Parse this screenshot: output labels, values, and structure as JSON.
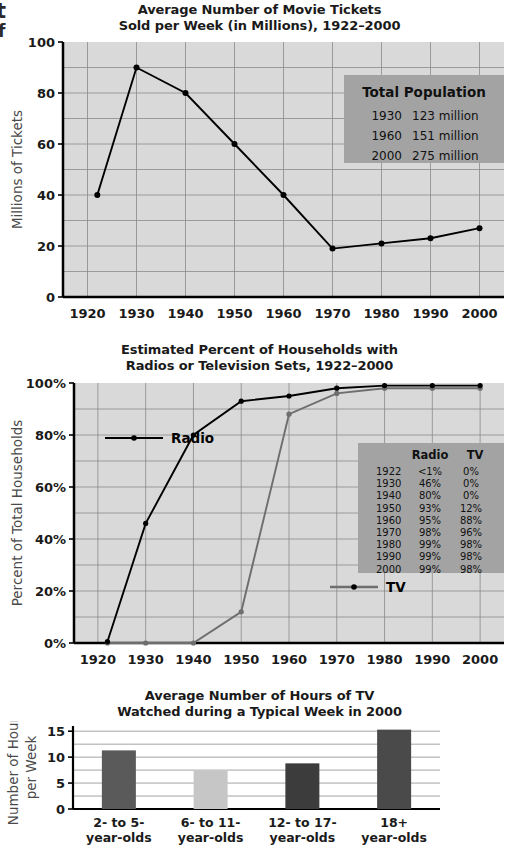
{
  "page": {
    "cut_off_margin_line1": "t",
    "cut_off_margin_line2": "f"
  },
  "chart_data": [
    {
      "id": "movie-tickets",
      "type": "line",
      "title_line1": "Average Number of Movie Tickets",
      "title_line2": "Sold per Week (in Millions), 1922–2000",
      "xlabel": "",
      "ylabel": "Millions of Tickets",
      "xlim": [
        1915,
        2005
      ],
      "ylim": [
        0,
        100
      ],
      "xticks": [
        "1920",
        "1930",
        "1940",
        "1950",
        "1960",
        "1970",
        "1980",
        "1990",
        "2000"
      ],
      "xtick_values": [
        1920,
        1930,
        1940,
        1950,
        1960,
        1970,
        1980,
        1990,
        2000
      ],
      "yticks": [
        "0",
        "20",
        "40",
        "60",
        "80",
        "100"
      ],
      "ytick_values": [
        0,
        20,
        40,
        60,
        80,
        100
      ],
      "grid": true,
      "x": [
        1922,
        1930,
        1940,
        1950,
        1960,
        1970,
        1980,
        1990,
        2000
      ],
      "values": [
        40,
        90,
        80,
        60,
        40,
        19,
        21,
        23,
        27
      ],
      "series_color": "#000000",
      "plot_bg": "#d9d9d9",
      "annotation_box": {
        "title": "Total Population",
        "rows": [
          {
            "year": "1930",
            "population": "123 million"
          },
          {
            "year": "1960",
            "population": "151 million"
          },
          {
            "year": "2000",
            "population": "275 million"
          }
        ],
        "bg": "#a3a3a3"
      }
    },
    {
      "id": "radio-tv-households",
      "type": "line",
      "title_line1": "Estimated Percent of Households with",
      "title_line2": "Radios or Television Sets, 1922–2000",
      "xlabel": "",
      "ylabel": "Percent of Total Households",
      "xlim": [
        1915,
        2005
      ],
      "ylim": [
        0,
        100
      ],
      "xticks": [
        "1920",
        "1930",
        "1940",
        "1950",
        "1960",
        "1970",
        "1980",
        "1990",
        "2000"
      ],
      "xtick_values": [
        1920,
        1930,
        1940,
        1950,
        1960,
        1970,
        1980,
        1990,
        2000
      ],
      "yticks": [
        "0%",
        "20%",
        "40%",
        "60%",
        "80%",
        "100%"
      ],
      "ytick_values": [
        0,
        20,
        40,
        60,
        80,
        100
      ],
      "grid": true,
      "x": [
        1922,
        1930,
        1940,
        1950,
        1960,
        1970,
        1980,
        1990,
        2000
      ],
      "series": [
        {
          "name": "Radio",
          "values": [
            0.5,
            46,
            80,
            93,
            95,
            98,
            99,
            99,
            99
          ],
          "color": "#000000"
        },
        {
          "name": "TV",
          "values": [
            0,
            0,
            0,
            12,
            88,
            96,
            98,
            98,
            98
          ],
          "color": "#6e6e6e"
        }
      ],
      "legend": [
        {
          "label": "Radio",
          "color": "#000000"
        },
        {
          "label": "TV",
          "color": "#6e6e6e"
        }
      ],
      "plot_bg": "#d9d9d9",
      "data_table": {
        "columns": [
          "",
          "Radio",
          "TV"
        ],
        "rows": [
          [
            "1922",
            "<1%",
            "0%"
          ],
          [
            "1930",
            "46%",
            "0%"
          ],
          [
            "1940",
            "80%",
            "0%"
          ],
          [
            "1950",
            "93%",
            "12%"
          ],
          [
            "1960",
            "95%",
            "88%"
          ],
          [
            "1970",
            "98%",
            "96%"
          ],
          [
            "1980",
            "99%",
            "98%"
          ],
          [
            "1990",
            "99%",
            "98%"
          ],
          [
            "2000",
            "99%",
            "98%"
          ]
        ],
        "bg": "#a3a3a3"
      }
    },
    {
      "id": "tv-hours-by-age",
      "type": "bar",
      "title_line1": "Average Number of Hours of TV",
      "title_line2": "Watched during a Typical Week in 2000",
      "xlabel": "",
      "ylabel_line1": "Number of Hours",
      "ylabel_line2": "per Week",
      "ylim": [
        0,
        16
      ],
      "yticks": [
        "0",
        "5",
        "10",
        "15"
      ],
      "ytick_values": [
        0,
        5,
        10,
        15
      ],
      "grid": true,
      "categories": [
        "2- to 5-\nyear-olds",
        "6- to 11-\nyear-olds",
        "12- to 17-\nyear-olds",
        "18+\nyear-olds"
      ],
      "category_lines": [
        [
          "2- to 5-",
          "year-olds"
        ],
        [
          "6- to 11-",
          "year-olds"
        ],
        [
          "12- to 17-",
          "year-olds"
        ],
        [
          "18+",
          "year-olds"
        ]
      ],
      "values": [
        11.3,
        7.4,
        8.8,
        15.3
      ],
      "bar_colors": [
        "#5a5a5a",
        "#c6c6c6",
        "#3c3c3c",
        "#4a4a4a"
      ]
    }
  ]
}
